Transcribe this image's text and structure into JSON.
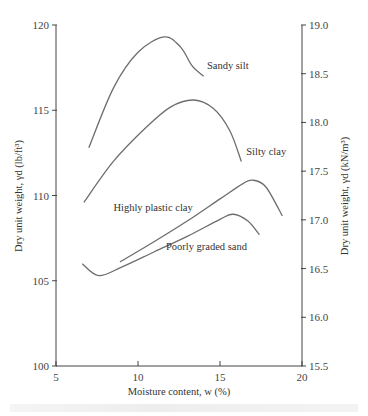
{
  "chart_data": {
    "type": "line",
    "title": "",
    "xlabel": "Moisture content, w (%)",
    "ylabel": "Dry unit weight, γd (lb/ft³)",
    "ylabel_right": "Dry unit weight, γd (kN/m³)",
    "xlim": [
      5,
      20
    ],
    "ylim": [
      100,
      120
    ],
    "ylim_right": [
      15.5,
      19.0
    ],
    "xticks": [
      "5",
      "10",
      "15",
      "20"
    ],
    "yticks": [
      "100",
      "105",
      "110",
      "115",
      "120"
    ],
    "yticks_right": [
      "15.5",
      "16.0",
      "16.5",
      "17.0",
      "17.5",
      "18.0",
      "18.5",
      "19.0"
    ],
    "grid": false,
    "legend": "inline labels",
    "series": [
      {
        "name": "Sandy silt",
        "x": [
          7.0,
          8.5,
          10.0,
          11.6,
          12.6,
          13.3,
          14.0
        ],
        "y": [
          112.8,
          116.3,
          118.4,
          119.3,
          118.7,
          117.6,
          117.0
        ]
      },
      {
        "name": "Silty clay",
        "x": [
          6.7,
          8.5,
          10.5,
          12.0,
          13.4,
          14.6,
          15.6,
          16.3
        ],
        "y": [
          109.6,
          112.0,
          114.0,
          115.2,
          115.6,
          115.1,
          113.8,
          112.0
        ]
      },
      {
        "name": "Highly plastic clay",
        "x": [
          8.9,
          11.0,
          13.0,
          15.0,
          16.4,
          17.0,
          17.8,
          18.8
        ],
        "y": [
          106.1,
          107.3,
          108.5,
          109.8,
          110.7,
          110.9,
          110.5,
          108.8
        ]
      },
      {
        "name": "Poorly graded sand",
        "x": [
          6.6,
          7.6,
          9.0,
          11.0,
          13.0,
          15.0,
          15.8,
          16.7,
          17.4
        ],
        "y": [
          106.0,
          105.3,
          105.8,
          106.7,
          107.6,
          108.6,
          108.9,
          108.5,
          107.7
        ]
      }
    ],
    "annotations": [
      {
        "text": "Sandy silt",
        "x": 14.2,
        "y": 117.4
      },
      {
        "text": "Silty clay",
        "x": 16.6,
        "y": 112.4
      },
      {
        "text": "Highly plastic clay",
        "x": 8.5,
        "y": 109.1
      },
      {
        "text": "Poorly graded sand",
        "x": 11.7,
        "y": 106.8
      }
    ]
  },
  "colors": {
    "curve": "#6d6d6d",
    "axis": "#444444",
    "text": "#333333"
  }
}
